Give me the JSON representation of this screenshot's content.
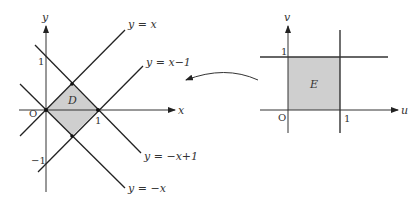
{
  "left_diagram": {
    "axes": {
      "x_label": "x",
      "y_label": "y",
      "origin_label": "O"
    },
    "ticks": {
      "x_one": "1",
      "y_one": "1",
      "y_minus_one": "−1"
    },
    "region_label": "D",
    "lines": [
      {
        "equation": "y = x",
        "label": "y = x"
      },
      {
        "equation": "y = x − 1",
        "label": "y = x−1"
      },
      {
        "equation": "y = −x + 1",
        "label": "y = −x+1"
      },
      {
        "equation": "y = −x",
        "label": "y = −x"
      }
    ],
    "region_vertices": [
      [
        0,
        0
      ],
      [
        0.5,
        0.5
      ],
      [
        1,
        0
      ],
      [
        0.5,
        -0.5
      ]
    ],
    "fill_color": "#cfcfcf"
  },
  "right_diagram": {
    "axes": {
      "x_label": "u",
      "y_label": "v",
      "origin_label": "O"
    },
    "ticks": {
      "u_one": "1",
      "v_one": "1"
    },
    "region_label": "E",
    "lines": [
      {
        "equation": "v = 1"
      },
      {
        "equation": "u = 1"
      }
    ],
    "region_vertices": [
      [
        0,
        0
      ],
      [
        1,
        0
      ],
      [
        1,
        1
      ],
      [
        0,
        1
      ]
    ],
    "fill_color": "#cfcfcf"
  },
  "mapping_arrow": {
    "direction": "from right (E) to left (D)"
  }
}
